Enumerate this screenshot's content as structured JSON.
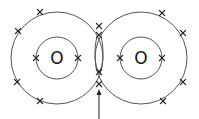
{
  "diagram": {
    "title": "",
    "type": "dot-and-cross diagram (O2 double covalent bond)",
    "atoms": [
      {
        "label": "O",
        "center": [
          57,
          58
        ],
        "inner_shell_radius": 21,
        "outer_shell_radius": 46,
        "inner_electrons": [
          [
            36,
            58
          ],
          [
            78,
            58
          ]
        ],
        "outer_electrons": [
          [
            40,
            12
          ],
          [
            18,
            31
          ],
          [
            17,
            82
          ],
          [
            40,
            101
          ]
        ]
      },
      {
        "label": "O",
        "center": [
          141,
          58
        ],
        "inner_shell_radius": 21,
        "outer_shell_radius": 46,
        "inner_electrons": [
          [
            120,
            58
          ],
          [
            162,
            58
          ]
        ],
        "outer_electrons": [
          [
            162,
            13
          ],
          [
            183,
            33
          ],
          [
            183,
            82
          ],
          [
            163,
            101
          ]
        ]
      }
    ],
    "shared_electrons": [
      [
        99,
        26
      ],
      [
        99,
        35
      ],
      [
        99,
        72
      ],
      [
        99,
        84
      ]
    ],
    "bond_region": {
      "label": "",
      "arrow_from": [
        99,
        119
      ],
      "arrow_to": [
        99,
        90
      ]
    },
    "colors": {
      "line": "#555555",
      "mark": "#222222",
      "background": "#ffffff"
    }
  }
}
